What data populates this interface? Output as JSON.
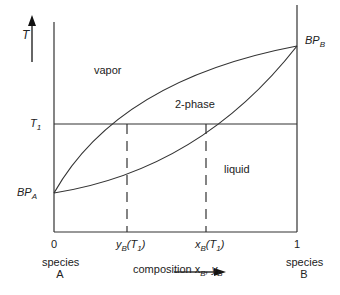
{
  "diagram": {
    "type": "binary phase diagram (T-x-y)",
    "y_axis_label": "T",
    "x_axis_label": "composition x",
    "x_axis_label_sub1": "B",
    "x_axis_label_mid": ", y",
    "x_axis_label_sub2": "B",
    "regions": {
      "vapor": "vapor",
      "two_phase": "2-phase",
      "liquid": "liquid"
    },
    "t1_label": "T",
    "t1_sub": "1",
    "bp_a_label": "BP",
    "bp_a_sub": "A",
    "bp_b_label": "BP",
    "bp_b_sub": "B",
    "x_tick_left": "0",
    "x_tick_right": "1",
    "species_a_line1": "species",
    "species_a_line2": "A",
    "species_b_line1": "species",
    "species_b_line2": "B",
    "yb_label": "y",
    "yb_sub": "B",
    "yb_arg": "(T",
    "yb_arg_sub": "1",
    "yb_close": ")",
    "xb_label": "x",
    "xb_sub": "B",
    "xb_arg": "(T",
    "xb_arg_sub": "1",
    "xb_close": ")"
  }
}
